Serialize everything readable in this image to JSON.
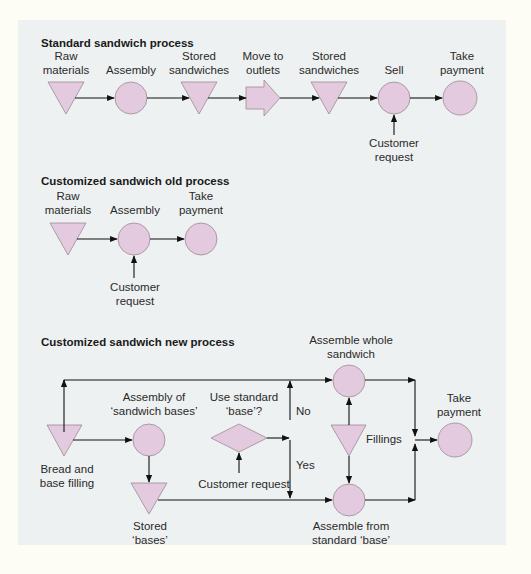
{
  "colors": {
    "page_background": "#fdfdf6",
    "panel_background": "#eef1f1",
    "shape_fill": "#e4cade",
    "shape_stroke": "#9a8a96",
    "line": "#111111"
  },
  "standard": {
    "title": "Standard sandwich process",
    "steps": [
      {
        "shape": "triangle",
        "label": "Raw\nmaterials"
      },
      {
        "shape": "circle",
        "label": "Assembly"
      },
      {
        "shape": "triangle",
        "label": "Stored\nsandwiches"
      },
      {
        "shape": "arrow",
        "label": "Move to\noutlets"
      },
      {
        "shape": "triangle",
        "label": "Stored\nsandwiches"
      },
      {
        "shape": "circle",
        "label": "Sell"
      },
      {
        "shape": "circle",
        "label": "Take\npayment"
      }
    ],
    "labels": {
      "raw_materials_1": "Raw",
      "raw_materials_2": "materials",
      "assembly": "Assembly",
      "stored_1_1": "Stored",
      "stored_1_2": "sandwiches",
      "move_1": "Move to",
      "move_2": "outlets",
      "stored_2_1": "Stored",
      "stored_2_2": "sandwiches",
      "sell": "Sell",
      "take_1": "Take",
      "take_2": "payment",
      "customer_1": "Customer",
      "customer_2": "request"
    }
  },
  "old": {
    "title": "Customized sandwich old process",
    "labels": {
      "raw_1": "Raw",
      "raw_2": "materials",
      "assembly": "Assembly",
      "take_1": "Take",
      "take_2": "payment",
      "customer_1": "Customer",
      "customer_2": "request"
    }
  },
  "new": {
    "title": "Customized sandwich new process",
    "labels": {
      "assemble_whole_1": "Assemble whole",
      "assemble_whole_2": "sandwich",
      "assembly_bases_1": "Assembly of",
      "assembly_bases_2": "‘sandwich bases’",
      "use_standard_1": "Use standard",
      "use_standard_2": "‘base’?",
      "no": "No",
      "yes": "Yes",
      "fillings": "Fillings",
      "take_1": "Take",
      "take_2": "payment",
      "bread_1": "Bread and",
      "bread_2": "base filling",
      "customer_request": "Customer request",
      "stored_1": "Stored",
      "stored_2": "‘bases’",
      "assemble_from_1": "Assemble from",
      "assemble_from_2": "standard ‘base’"
    }
  }
}
